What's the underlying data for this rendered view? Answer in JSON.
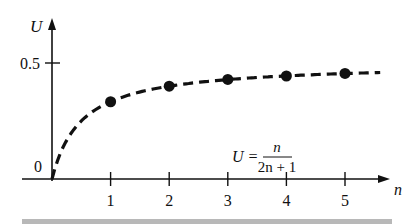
{
  "chart_data": {
    "type": "scatter",
    "title": "",
    "xlabel": "n",
    "ylabel": "U",
    "x_ticks": [
      "1",
      "2",
      "3",
      "4",
      "5"
    ],
    "y_ticks": [
      "0",
      "0.5"
    ],
    "xlim": [
      0,
      5.7
    ],
    "ylim": [
      0,
      0.65
    ],
    "grid": false,
    "legend": null,
    "annotation": {
      "lhs": "U =",
      "numerator": "n",
      "denominator": "2n + 1"
    },
    "series": [
      {
        "name": "points",
        "style": "filled-circle-markers",
        "x": [
          1,
          2,
          3,
          4,
          5
        ],
        "values": [
          0.333,
          0.4,
          0.429,
          0.444,
          0.455
        ]
      },
      {
        "name": "curve U = n/(2n+1)",
        "style": "dashed-line",
        "x": [
          0,
          0.5,
          1,
          2,
          3,
          4,
          5,
          5.6
        ],
        "values": [
          0,
          0.25,
          0.333,
          0.4,
          0.429,
          0.444,
          0.455,
          0.459
        ]
      }
    ]
  },
  "colors": {
    "ink": "#111111",
    "footer_bar": "#b8b8b8"
  }
}
